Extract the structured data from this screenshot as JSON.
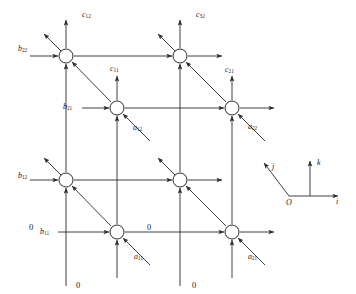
{
  "figure": {
    "title_cropped": "",
    "node_count": 8,
    "node_radius_px": 7,
    "stroke_color": "#2b2b2b",
    "background_color": "#ffffff"
  },
  "labels": {
    "outputs": [
      {
        "id": "c12",
        "base": "c",
        "sub": "12",
        "x": 82,
        "y": 11
      },
      {
        "id": "c32",
        "base": "c",
        "sub": "32",
        "x": 196,
        "y": 11
      },
      {
        "id": "c11",
        "base": "c",
        "sub": "11",
        "x": 110,
        "y": 65
      },
      {
        "id": "c21",
        "base": "c",
        "sub": "21",
        "x": 225,
        "y": 66
      }
    ],
    "b_inputs": [
      {
        "id": "b22",
        "base": "b",
        "sub": "22",
        "x": 18,
        "y": 45
      },
      {
        "id": "b21",
        "base": "b",
        "sub": "21",
        "x": 63,
        "y": 103
      },
      {
        "id": "b12",
        "base": "b",
        "sub": "12",
        "x": 18,
        "y": 172
      },
      {
        "id": "b11",
        "base": "b",
        "sub": "11",
        "x": 40,
        "y": 228
      }
    ],
    "a_inputs": [
      {
        "id": "a12",
        "base": "a",
        "sub": "12",
        "x": 133,
        "y": 124
      },
      {
        "id": "a22",
        "base": "a",
        "sub": "22",
        "x": 248,
        "y": 123
      },
      {
        "id": "a11",
        "base": "a",
        "sub": "11",
        "x": 134,
        "y": 253
      },
      {
        "id": "a21",
        "base": "a",
        "sub": "21",
        "x": 248,
        "y": 253
      }
    ],
    "zeros": [
      {
        "id": "zero-left",
        "text": "0",
        "x": 29,
        "y": 223
      },
      {
        "id": "zero-mid-bottom",
        "text": "0",
        "x": 147,
        "y": 223
      },
      {
        "id": "zero-bottom-left",
        "text": "0",
        "x": 76,
        "y": 281
      },
      {
        "id": "zero-bottom-right",
        "text": "0",
        "x": 192,
        "y": 281
      }
    ]
  },
  "axes": {
    "origin_label": "O",
    "i_label": "i",
    "j_label": "j",
    "k_label": "k",
    "origin": {
      "x": 289,
      "y": 196
    },
    "i_tip": {
      "x": 341,
      "y": 196
    },
    "j_tip": {
      "x": 261,
      "y": 160
    },
    "k_tip": {
      "x": 310,
      "y": 158
    }
  },
  "nodes": [
    {
      "id": "node-back-top-left",
      "x": 66,
      "y": 56,
      "layer": "back",
      "row": "top",
      "col": "left"
    },
    {
      "id": "node-back-top-right",
      "x": 180,
      "y": 56,
      "layer": "back",
      "row": "top",
      "col": "right"
    },
    {
      "id": "node-front-top-left",
      "x": 117,
      "y": 108,
      "layer": "front",
      "row": "top",
      "col": "left"
    },
    {
      "id": "node-front-top-right",
      "x": 232,
      "y": 108,
      "layer": "front",
      "row": "top",
      "col": "right"
    },
    {
      "id": "node-back-bottom-left",
      "x": 66,
      "y": 180,
      "layer": "back",
      "row": "bottom",
      "col": "left"
    },
    {
      "id": "node-back-bottom-right",
      "x": 180,
      "y": 180,
      "layer": "back",
      "row": "bottom",
      "col": "right"
    },
    {
      "id": "node-front-bottom-left",
      "x": 117,
      "y": 232,
      "layer": "front",
      "row": "bottom",
      "col": "left"
    },
    {
      "id": "node-front-bottom-right",
      "x": 232,
      "y": 232,
      "layer": "front",
      "row": "bottom",
      "col": "right"
    }
  ]
}
